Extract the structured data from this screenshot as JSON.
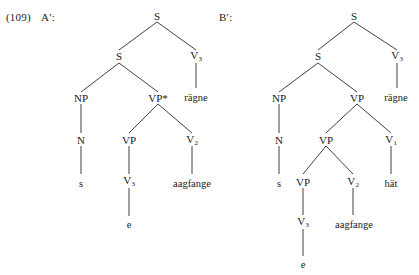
{
  "figure": {
    "example_number": "(109)",
    "text_color": "#1a1a1a",
    "line_color": "#2b2b2b",
    "background": "#ffffff"
  },
  "trees": [
    {
      "label": "A′:",
      "label_name": "tree-a-label",
      "nodes": {
        "root_s": "S",
        "inner_s": "S",
        "np": "NP",
        "n": "N",
        "n_terminal": "s",
        "vp_star": "VP*",
        "vp_inner": "VP",
        "v3_under_vp": "V",
        "v3_under_vp_sub": "3",
        "v3_terminal": "e",
        "v2": "V",
        "v2_sub": "2",
        "v2_terminal": "aagfange",
        "v3_top": "V",
        "v3_top_sub": "3",
        "v3_top_terminal": "rägne"
      }
    },
    {
      "label": "B′:",
      "label_name": "tree-b-label",
      "nodes": {
        "root_s": "S",
        "inner_s": "S",
        "np": "NP",
        "n": "N",
        "n_terminal": "s",
        "vp_outer": "VP",
        "vp_mid": "VP",
        "vp_inner": "VP",
        "v3_deep": "V",
        "v3_deep_sub": "3",
        "v3_deep_terminal": "e",
        "v2": "V",
        "v2_sub": "2",
        "v2_terminal": "aagfange",
        "v1": "V",
        "v1_sub": "1",
        "v1_terminal": "hät",
        "v3_top": "V",
        "v3_top_sub": "3",
        "v3_top_terminal": "rägne"
      }
    }
  ]
}
